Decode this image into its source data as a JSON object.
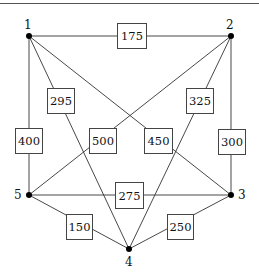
{
  "graph": {
    "title": "",
    "nodes": [
      {
        "id": "1",
        "label": "1",
        "x": 29,
        "y": 36
      },
      {
        "id": "2",
        "label": "2",
        "x": 231,
        "y": 36
      },
      {
        "id": "3",
        "label": "3",
        "x": 231,
        "y": 195
      },
      {
        "id": "4",
        "label": "4",
        "x": 129,
        "y": 249
      },
      {
        "id": "5",
        "label": "5",
        "x": 29,
        "y": 195
      }
    ],
    "edges": [
      {
        "from": "1",
        "to": "2",
        "weight": "175"
      },
      {
        "from": "1",
        "to": "5",
        "weight": "400"
      },
      {
        "from": "1",
        "to": "4",
        "weight": "295"
      },
      {
        "from": "1",
        "to": "3",
        "weight": "450"
      },
      {
        "from": "2",
        "to": "3",
        "weight": "300"
      },
      {
        "from": "2",
        "to": "4",
        "weight": "325"
      },
      {
        "from": "2",
        "to": "5",
        "weight": "500"
      },
      {
        "from": "5",
        "to": "3",
        "weight": "275"
      },
      {
        "from": "5",
        "to": "4",
        "weight": "150"
      },
      {
        "from": "3",
        "to": "4",
        "weight": "250"
      }
    ]
  },
  "labels": {
    "n1": "1",
    "n2": "2",
    "n3": "3",
    "n4": "4",
    "n5": "5",
    "w12": "175",
    "w15": "400",
    "w14": "295",
    "w13": "450",
    "w23": "300",
    "w24": "325",
    "w25": "500",
    "w53": "275",
    "w54": "150",
    "w34": "250"
  }
}
